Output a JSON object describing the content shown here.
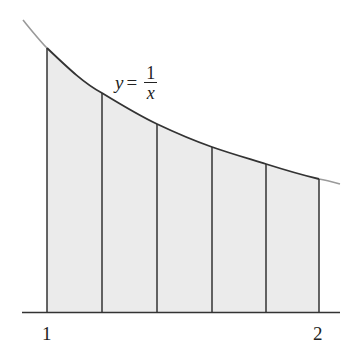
{
  "diagram": {
    "function_label": {
      "lhs": "y",
      "equals": "=",
      "numerator": "1",
      "denominator": "x"
    },
    "x_axis": {
      "tick_labels": [
        "1",
        "2"
      ]
    },
    "curve": {
      "expression": "1/x",
      "domain_drawn": [
        0.86,
        2.06
      ],
      "color_outside": "#9a9a9a",
      "color_inside": "#333333"
    },
    "partition": {
      "from": 1,
      "to": 2,
      "subintervals": 5,
      "points": [
        1,
        1.2,
        1.4,
        1.6,
        1.8,
        2
      ]
    },
    "shading": {
      "color": "#ebebeb"
    }
  }
}
